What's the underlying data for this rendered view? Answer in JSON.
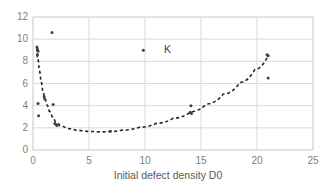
{
  "chart_data": {
    "type": "scatter",
    "title": "",
    "xlabel": "Initial defect density D0",
    "ylabel": "",
    "xlim": [
      0,
      25
    ],
    "ylim": [
      0,
      12
    ],
    "xticks": [
      "0",
      "5",
      "10",
      "15",
      "20",
      "25"
    ],
    "yticks": [
      "0",
      "2",
      "4",
      "6",
      "8",
      "10",
      "12"
    ],
    "grid": true,
    "legend": "none",
    "marker_color": "#404040",
    "trend_color": "#262626",
    "grid_color": "#d9d9d9",
    "axis_text_color": "#7f7f7f",
    "series": [
      {
        "name": "K data points",
        "marker": "small-circle",
        "points": [
          {
            "x": 0.35,
            "y": 9.3
          },
          {
            "x": 0.4,
            "y": 9.1
          },
          {
            "x": 0.45,
            "y": 8.9
          },
          {
            "x": 0.4,
            "y": 8.6
          },
          {
            "x": 0.45,
            "y": 4.2
          },
          {
            "x": 0.5,
            "y": 3.1
          },
          {
            "x": 1.0,
            "y": 4.8
          },
          {
            "x": 1.05,
            "y": 4.6
          },
          {
            "x": 1.7,
            "y": 10.6
          },
          {
            "x": 1.8,
            "y": 4.1
          },
          {
            "x": 1.95,
            "y": 2.4
          },
          {
            "x": 2.05,
            "y": 2.3
          },
          {
            "x": 2.15,
            "y": 2.2
          },
          {
            "x": 6.9,
            "y": 1.7
          },
          {
            "x": 9.85,
            "y": 9.0
          },
          {
            "x": 14.05,
            "y": 3.4
          },
          {
            "x": 14.15,
            "y": 3.3
          },
          {
            "x": 14.1,
            "y": 4.0
          },
          {
            "x": 20.9,
            "y": 8.6
          },
          {
            "x": 21.0,
            "y": 8.5
          },
          {
            "x": 21.0,
            "y": 6.5
          }
        ]
      }
    ],
    "trendline": {
      "name": "fitted dashed curve",
      "style": "dashed",
      "points": [
        {
          "x": 0.3,
          "y": 9.2
        },
        {
          "x": 0.4,
          "y": 8.4
        },
        {
          "x": 0.55,
          "y": 7.2
        },
        {
          "x": 0.7,
          "y": 6.2
        },
        {
          "x": 0.85,
          "y": 5.4
        },
        {
          "x": 1.0,
          "y": 4.8
        },
        {
          "x": 1.2,
          "y": 4.1
        },
        {
          "x": 1.45,
          "y": 3.5
        },
        {
          "x": 1.7,
          "y": 3.0
        },
        {
          "x": 2.0,
          "y": 2.5
        },
        {
          "x": 2.4,
          "y": 2.2
        },
        {
          "x": 3.0,
          "y": 1.95
        },
        {
          "x": 3.8,
          "y": 1.78
        },
        {
          "x": 4.8,
          "y": 1.68
        },
        {
          "x": 6.0,
          "y": 1.63
        },
        {
          "x": 6.9,
          "y": 1.67
        },
        {
          "x": 8.0,
          "y": 1.8
        },
        {
          "x": 9.5,
          "y": 2.05
        },
        {
          "x": 11.0,
          "y": 2.4
        },
        {
          "x": 12.5,
          "y": 2.85
        },
        {
          "x": 14.1,
          "y": 3.45
        },
        {
          "x": 15.5,
          "y": 4.15
        },
        {
          "x": 17.0,
          "y": 5.05
        },
        {
          "x": 18.5,
          "y": 6.1
        },
        {
          "x": 19.8,
          "y": 7.25
        },
        {
          "x": 21.0,
          "y": 8.55
        }
      ]
    },
    "annotations": [
      {
        "text": "K",
        "x": 11.7,
        "y": 9.0
      }
    ]
  }
}
